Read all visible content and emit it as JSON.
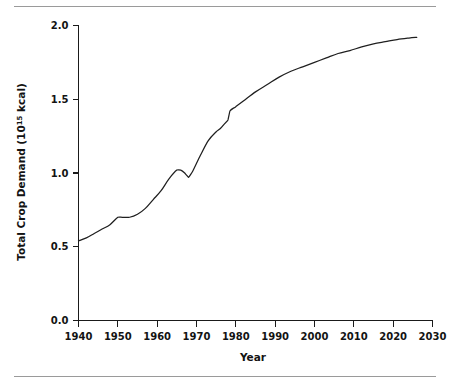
{
  "figure": {
    "name": "total-crop-demand-line-chart",
    "top_rule_color": "#9a9a9a",
    "bottom_rule_color": "#9a9a9a",
    "line_color": "#1f1f1f",
    "axis_color": "#1a1a1a",
    "background": "#ffffff"
  },
  "chart_data": {
    "type": "line",
    "title": "",
    "xlabel": "Year",
    "ylabel": "Total Crop Demand (10¹⁵ kcal)",
    "ylabel_base": "Total Crop Demand (10",
    "ylabel_exponent": "15",
    "ylabel_tail": " kcal)",
    "xlim": [
      1936,
      2030
    ],
    "ylim": [
      0.0,
      2.0
    ],
    "xticks": [
      1940,
      1950,
      1960,
      1970,
      1980,
      1990,
      2000,
      2010,
      2020,
      2030
    ],
    "xtick_labels": [
      "1940",
      "1950",
      "1960",
      "1970",
      "1980",
      "1990",
      "2000",
      "2010",
      "2020",
      "2030"
    ],
    "yticks": [
      0.0,
      0.5,
      1.0,
      1.5,
      2.0
    ],
    "ytick_labels": [
      "0.0",
      "0.5",
      "1.0",
      "1.5",
      "2.0"
    ],
    "grid": false,
    "legend": false,
    "legend_position": "none",
    "series": [
      {
        "name": "Total Crop Demand",
        "x": [
          1940,
          1942,
          1944,
          1946,
          1948,
          1950,
          1951,
          1953,
          1955,
          1957,
          1959,
          1961,
          1963,
          1965,
          1966,
          1967,
          1968,
          1969,
          1971,
          1973,
          1975,
          1976,
          1977,
          1978,
          1978.5,
          1980,
          1982,
          1985,
          1988,
          1991,
          1994,
          1997,
          2000,
          2003,
          2006,
          2009,
          2012,
          2015,
          2018,
          2021,
          2024,
          2026
        ],
        "y": [
          0.54,
          0.56,
          0.59,
          0.62,
          0.65,
          0.7,
          0.7,
          0.7,
          0.72,
          0.76,
          0.82,
          0.88,
          0.96,
          1.02,
          1.02,
          1.0,
          0.97,
          1.01,
          1.12,
          1.22,
          1.28,
          1.3,
          1.33,
          1.36,
          1.42,
          1.45,
          1.49,
          1.55,
          1.6,
          1.65,
          1.69,
          1.72,
          1.75,
          1.78,
          1.81,
          1.83,
          1.855,
          1.875,
          1.89,
          1.905,
          1.915,
          1.92
        ]
      }
    ],
    "annotations": [
      {
        "label": "plateau",
        "x_range": [
          1950,
          1953
        ],
        "y": 0.7
      },
      {
        "label": "local-peak",
        "x": 1965,
        "y": 1.02
      },
      {
        "label": "local-trough",
        "x": 1968,
        "y": 0.97
      },
      {
        "label": "step-discontinuity",
        "x": 1978,
        "y_from": 1.36,
        "y_to": 1.42
      },
      {
        "label": "series-end",
        "x": 2026,
        "y": 1.92
      }
    ]
  }
}
